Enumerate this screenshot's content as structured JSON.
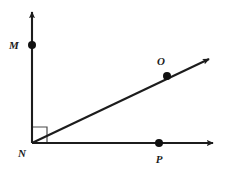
{
  "figure": {
    "background_color": "#ffffff",
    "stroke_color": "#1c1c1c",
    "label_color": "#1c1c1c",
    "width": 226,
    "height": 172
  },
  "vertex": {
    "name": "N",
    "label": "N",
    "x": 32,
    "y": 143,
    "label_x": 22,
    "label_y": 157
  },
  "rays": [
    {
      "name": "ray-nm-vertical",
      "label": "NM",
      "from_x": 32,
      "from_y": 143,
      "to_x": 32,
      "to_y": 12,
      "arrow": "true"
    },
    {
      "name": "ray-np-horizontal",
      "label": "NP",
      "from_x": 32,
      "from_y": 143,
      "to_x": 213,
      "to_y": 143,
      "arrow": "true"
    },
    {
      "name": "ray-no-diagonal",
      "label": "NO",
      "from_x": 32,
      "from_y": 143,
      "to_x": 209,
      "to_y": 59,
      "arrow": "true"
    }
  ],
  "points": [
    {
      "name": "point-m",
      "label": "M",
      "x": 32,
      "y": 45,
      "radius": 4,
      "label_x": 14,
      "label_y": 49
    },
    {
      "name": "point-o",
      "label": "O",
      "x": 167,
      "y": 76,
      "radius": 4,
      "label_x": 161,
      "label_y": 65
    },
    {
      "name": "point-p",
      "label": "P",
      "x": 159,
      "y": 143,
      "radius": 4,
      "label_x": 155,
      "label_y": 163
    }
  ],
  "right_angle_marker": {
    "name": "right-angle-marker",
    "description": "square marking the right angle at N between ray NM and ray NO",
    "points": "32,127 47,127 47,143"
  }
}
